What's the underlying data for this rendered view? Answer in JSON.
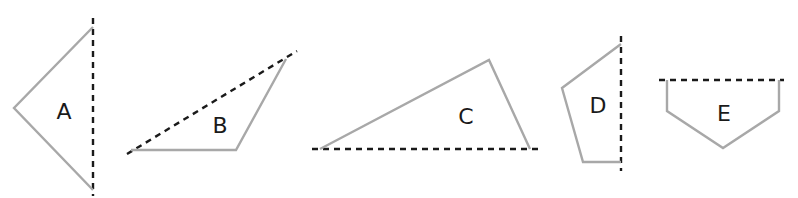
{
  "figure": {
    "colors": {
      "outline": "#a8a8a8",
      "dashed_line": "#1a1a1a",
      "label": "#1a1a1a"
    },
    "shapes": [
      {
        "label": "A",
        "line_of_symmetry": "vertical"
      },
      {
        "label": "B",
        "line_of_symmetry": "diagonal"
      },
      {
        "label": "C",
        "line_of_symmetry": "horizontal"
      },
      {
        "label": "D",
        "line_of_symmetry": "vertical"
      },
      {
        "label": "E",
        "line_of_symmetry": "horizontal"
      }
    ]
  }
}
